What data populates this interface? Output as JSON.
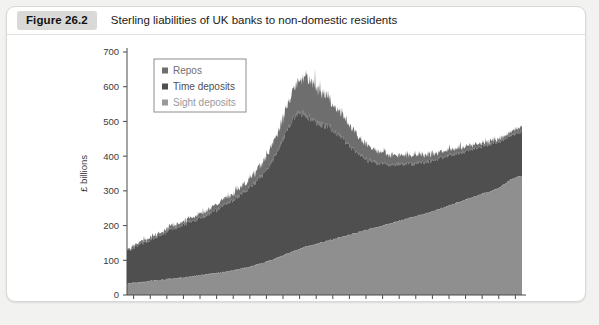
{
  "figure": {
    "badge": "Figure 26.2",
    "title": "Sterling liabilities of UK banks to non-domestic residents"
  },
  "colors": {
    "sight_deposits": "#8f8f8f",
    "time_deposits": "#4f4f4f",
    "repos": "#6e6e6e",
    "axis": "#4a4a4a",
    "panel_background": "#ffffff",
    "page_background": "#f2f2f1",
    "badge_background": "#d9d9d7"
  },
  "chart_data": {
    "type": "area",
    "stacked": true,
    "title": "Sterling liabilities of UK banks to non-domestic residents",
    "xlabel": "",
    "ylabel": "£ billions",
    "ylim": [
      0,
      700
    ],
    "ytick_step": 100,
    "yticks": [
      0,
      100,
      200,
      300,
      400,
      500,
      600,
      700
    ],
    "xlim": [
      1997.6,
      2021.4
    ],
    "xticks": [
      1998,
      2000,
      2002,
      2004,
      2006,
      2008,
      2010,
      2012,
      2014,
      2016,
      2018,
      2020
    ],
    "xtick_labels": [
      "1998",
      "2000",
      "2002",
      "2004",
      "2006",
      "2008",
      "2010",
      "2012",
      "2014",
      "2016",
      "2018",
      "2020"
    ],
    "minor_xtick_step": 1,
    "grid": false,
    "legend_position": "upper-left-inside",
    "x": [
      1997.8,
      1998.0,
      1998.3,
      1998.6,
      1998.9,
      1999.2,
      1999.5,
      1999.8,
      2000.1,
      2000.4,
      2000.7,
      2001.0,
      2001.3,
      2001.6,
      2001.9,
      2002.2,
      2002.5,
      2002.8,
      2003.1,
      2003.4,
      2003.7,
      2004.0,
      2004.3,
      2004.6,
      2004.9,
      2005.2,
      2005.5,
      2005.8,
      2006.1,
      2006.4,
      2006.7,
      2007.0,
      2007.3,
      2007.6,
      2007.9,
      2008.2,
      2008.5,
      2008.8,
      2009.1,
      2009.4,
      2009.7,
      2010.0,
      2010.3,
      2010.6,
      2010.9,
      2011.2,
      2011.5,
      2011.8,
      2012.1,
      2012.4,
      2012.7,
      2013.0,
      2013.3,
      2013.6,
      2013.9,
      2014.2,
      2014.5,
      2014.8,
      2015.1,
      2015.4,
      2015.7,
      2016.0,
      2016.3,
      2016.6,
      2016.9,
      2017.2,
      2017.5,
      2017.8,
      2018.1,
      2018.4,
      2018.7,
      2019.0,
      2019.3,
      2019.6,
      2019.9,
      2020.2,
      2020.5,
      2020.8,
      2021.1,
      2021.3
    ],
    "series": [
      {
        "name": "Sight deposits",
        "color": "#8f8f8f",
        "order": 1,
        "values": [
          33,
          35,
          36,
          38,
          39,
          41,
          42,
          44,
          46,
          47,
          49,
          50,
          52,
          54,
          56,
          58,
          60,
          62,
          64,
          66,
          68,
          71,
          74,
          77,
          80,
          84,
          88,
          92,
          97,
          102,
          108,
          114,
          120,
          126,
          131,
          136,
          140,
          144,
          148,
          152,
          156,
          160,
          164,
          168,
          172,
          176,
          180,
          184,
          188,
          192,
          196,
          200,
          204,
          208,
          212,
          216,
          220,
          224,
          228,
          232,
          236,
          241,
          246,
          251,
          256,
          261,
          266,
          271,
          276,
          281,
          286,
          291,
          296,
          301,
          306,
          315,
          325,
          334,
          340,
          342
        ]
      },
      {
        "name": "Time deposits",
        "color": "#4f4f4f",
        "order": 2,
        "values": [
          98,
          102,
          108,
          113,
          117,
          122,
          128,
          133,
          139,
          144,
          148,
          152,
          156,
          160,
          164,
          168,
          172,
          178,
          184,
          190,
          196,
          203,
          210,
          218,
          226,
          234,
          244,
          256,
          270,
          288,
          310,
          335,
          360,
          380,
          392,
          390,
          375,
          360,
          348,
          338,
          330,
          318,
          300,
          282,
          262,
          244,
          228,
          214,
          202,
          192,
          184,
          178,
          172,
          168,
          164,
          160,
          157,
          154,
          152,
          150,
          148,
          147,
          146,
          145,
          144,
          143,
          142,
          141,
          140,
          139,
          138,
          137,
          136,
          135,
          134,
          132,
          130,
          128,
          127,
          126
        ]
      },
      {
        "name": "Repos",
        "color": "#6e6e6e",
        "order": 3,
        "values": [
          4,
          5,
          6,
          6,
          7,
          7,
          8,
          8,
          9,
          9,
          10,
          10,
          11,
          11,
          12,
          12,
          13,
          14,
          15,
          16,
          17,
          18,
          20,
          22,
          24,
          27,
          30,
          34,
          39,
          45,
          52,
          60,
          70,
          82,
          95,
          104,
          108,
          106,
          100,
          92,
          84,
          76,
          70,
          64,
          58,
          53,
          48,
          44,
          40,
          37,
          34,
          32,
          30,
          28,
          27,
          26,
          25,
          24,
          23,
          22,
          21,
          20,
          19,
          18,
          17,
          16,
          15,
          14,
          13,
          12,
          11,
          10,
          9,
          8,
          8,
          9,
          10,
          11,
          12,
          12
        ]
      }
    ],
    "annotations": {
      "peak_year": 2008,
      "peak_total_value": 630,
      "start_total_value": 135,
      "end_total_value": 480
    },
    "noise": {
      "enabled": true,
      "amplitude_sight": 4,
      "amplitude_time": 14,
      "amplitude_repos": 16,
      "seed": 20262
    }
  },
  "legend": {
    "items": [
      {
        "label": "Repos",
        "color": "#6e6e6e"
      },
      {
        "label": "Time deposits",
        "color": "#4f4f4f"
      },
      {
        "label": "Sight deposits",
        "color": "#9a9a9a"
      }
    ]
  }
}
